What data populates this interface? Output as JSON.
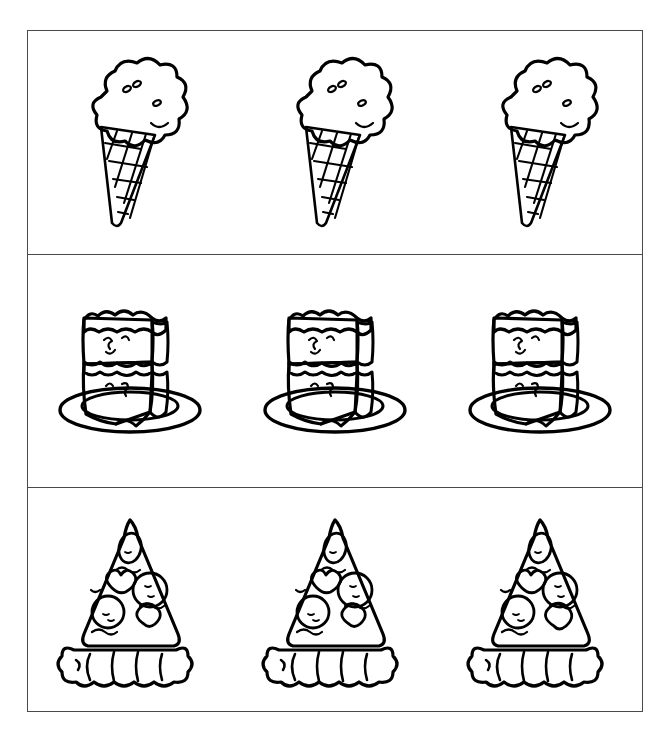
{
  "page": {
    "background_color": "#ffffff",
    "border_color": "#4a4a4a",
    "ink_color": "#000000",
    "shaded_color": "#8a8a8a",
    "filled_color": "#000000",
    "width": 662,
    "height": 730
  },
  "rows": [
    {
      "name": "ice-cream-row",
      "item_label": "ice cream cone",
      "items": [
        {
          "index": 1,
          "icon": "ice-cream-cone-icon",
          "scoop_fill": "#ffffff",
          "state": "plain",
          "odd_one_out": false
        },
        {
          "index": 2,
          "icon": "ice-cream-cone-icon",
          "scoop_fill": "#8a8a8a",
          "state": "shaded",
          "odd_one_out": true
        },
        {
          "index": 3,
          "icon": "ice-cream-cone-icon",
          "scoop_fill": "#ffffff",
          "state": "plain",
          "odd_one_out": false
        }
      ]
    },
    {
      "name": "cake-slice-row",
      "item_label": "cake slice on plate",
      "items": [
        {
          "index": 1,
          "icon": "cake-slice-icon",
          "plate_fill": "#000000",
          "state": "filled-plate",
          "odd_one_out": true
        },
        {
          "index": 2,
          "icon": "cake-slice-icon",
          "plate_fill": "#ffffff",
          "state": "plain",
          "odd_one_out": false
        },
        {
          "index": 3,
          "icon": "cake-slice-icon",
          "plate_fill": "#ffffff",
          "state": "plain",
          "odd_one_out": false
        }
      ]
    },
    {
      "name": "pizza-slice-row",
      "item_label": "pizza slice",
      "items": [
        {
          "index": 1,
          "icon": "pizza-slice-icon",
          "topping_fill": "#ffffff",
          "state": "plain",
          "odd_one_out": false
        },
        {
          "index": 2,
          "icon": "pizza-slice-icon",
          "topping_fill": "#ffffff",
          "state": "plain",
          "odd_one_out": false
        },
        {
          "index": 3,
          "icon": "pizza-slice-icon",
          "topping_fill": "#000000",
          "state": "filled-toppings",
          "odd_one_out": true
        }
      ]
    }
  ]
}
